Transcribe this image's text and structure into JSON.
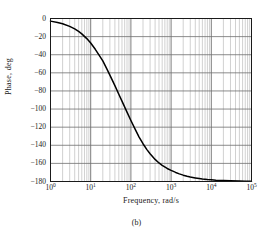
{
  "figure": {
    "caption": "(b)",
    "background_color": "#ffffff",
    "frame_color": "#1a1a1a"
  },
  "axes": {
    "ylabel": "Phase, deg",
    "xlabel": "Frequency, rad/s",
    "grid_major_color": "#6e6e6e",
    "grid_minor_color": "#bdbdbd",
    "curve_color": "#000000"
  },
  "chart_data": {
    "type": "line",
    "title": "",
    "subtitle": "",
    "xlabel": "Frequency, rad/s",
    "ylabel": "Phase, deg",
    "xscale": "log",
    "yscale": "linear",
    "xlim": [
      1,
      100000
    ],
    "ylim": [
      -180,
      0
    ],
    "grid": true,
    "legend": null,
    "xticks": [
      1,
      10,
      100,
      1000,
      10000,
      100000
    ],
    "xticklabels": [
      "10⁰",
      "10¹",
      "10²",
      "10³",
      "10⁴",
      "10⁵"
    ],
    "xtick_mantissas": [
      "10",
      "10",
      "10",
      "10",
      "10",
      "10"
    ],
    "xtick_exponents": [
      "0",
      "1",
      "2",
      "3",
      "4",
      "5"
    ],
    "yticks": [
      0,
      -20,
      -40,
      -60,
      -80,
      -100,
      -120,
      -140,
      -160,
      -180
    ],
    "yticklabels": [
      "0",
      "−20",
      "−40",
      "−60",
      "−80",
      "−100",
      "−120",
      "−140",
      "−160",
      "−180"
    ],
    "series": [
      {
        "name": "Phase",
        "description": "Second-order low-pass phase response, poles near 20 rad/s and 1000 rad/s",
        "poles_rad_per_s": [
          20,
          1000
        ],
        "x": [
          1,
          1.5,
          2,
          3,
          4,
          5,
          6,
          8,
          10,
          13,
          16,
          20,
          25,
          30,
          40,
          50,
          60,
          80,
          100,
          130,
          160,
          200,
          250,
          300,
          400,
          500,
          600,
          800,
          1000,
          1300,
          1600,
          2000,
          2500,
          3000,
          4000,
          5000,
          6000,
          8000,
          10000,
          13000,
          16000,
          20000,
          30000,
          50000,
          70000,
          100000
        ],
        "y": [
          -2.9,
          -4.4,
          -5.8,
          -8.7,
          -11.5,
          -14.3,
          -17.0,
          -22.2,
          -27.1,
          -34.0,
          -40.1,
          -46.8,
          -55.3,
          -62.5,
          -74.2,
          -83.6,
          -91.3,
          -103.4,
          -112.6,
          -123.0,
          -130.9,
          -138.3,
          -144.8,
          -149.4,
          -155.6,
          -159.5,
          -162.2,
          -165.6,
          -167.7,
          -170.0,
          -171.6,
          -173.0,
          -174.2,
          -175.1,
          -176.1,
          -176.8,
          -177.3,
          -177.9,
          -178.2,
          -178.6,
          -178.8,
          -179.0,
          -179.3,
          -179.5,
          -179.7,
          -179.8
        ],
        "crossover_minus90_rad_per_s": 150
      }
    ]
  }
}
